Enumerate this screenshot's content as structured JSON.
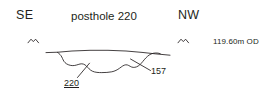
{
  "figure": {
    "type": "archaeological-section-drawing",
    "ink_color": "#231f20",
    "background_color": "#ffffff"
  },
  "orientation": {
    "left_label": "SE",
    "right_label": "NW"
  },
  "title": "posthole 220",
  "datum": {
    "level_text": "119.60m OD",
    "marker_icon": "datum-level-tick"
  },
  "context_labels": [
    {
      "number": "220",
      "type": "cut",
      "underlined": true,
      "leader_icon": "leader-line"
    },
    {
      "number": "157",
      "type": "fill",
      "underlined": false,
      "leader_icon": "leader-line"
    }
  ],
  "geometry": {
    "ground_surface_path": "M 50 54 L 72 51.5 L 100 50.5 L 128 51 L 150 53 L 163 54.5",
    "cut_profile_path": "M 57 52.5 L 62 56 L 65 61 L 70 64.5 L 76 65.5 L 82 64 L 88 66.5 L 95 70.5 L 104 72 L 114 71.5 L 122 68.5 L 128 66 L 134 67 L 140 66 L 146 62.5 L 151 58.5 L 156 55 L 160 53.5",
    "datum_tick_left": "M 28 42.5 L 33 38.5 L 38 42.5",
    "datum_tick_right": "M 178 42.5 L 183 38.5 L 188 42.5",
    "leader_220": "M 76 78 L 88 63",
    "leader_157": "M 150 70 L 131 59.5",
    "ground_left_tail": "M 46 52.5 L 57 52.5",
    "ground_right_tail": "M 160 53.5 L 170 54.5"
  }
}
